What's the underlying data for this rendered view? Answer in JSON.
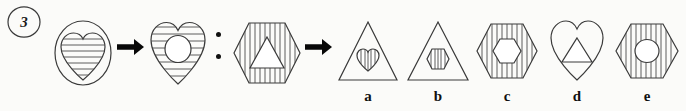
{
  "question": {
    "number": "3",
    "type": "visual-analogy",
    "relation_separator": ":",
    "arrow_symbol": "→"
  },
  "stem": {
    "pair_one": [
      {
        "position": 1,
        "name": "circle-with-striped-heart",
        "outer_shape": "circle",
        "outer_fill": "none",
        "inner_shape": "heart",
        "inner_fill": "horizontal-stripes"
      },
      {
        "position": 2,
        "name": "striped-heart-with-circle",
        "outer_shape": "heart",
        "outer_fill": "horizontal-stripes",
        "inner_shape": "circle",
        "inner_fill": "white"
      }
    ],
    "pair_two": [
      {
        "position": 3,
        "name": "striped-hexagon-with-triangle",
        "outer_shape": "hexagon",
        "outer_fill": "vertical-stripes",
        "inner_shape": "triangle",
        "inner_fill": "white"
      }
    ]
  },
  "options": [
    {
      "letter": "a",
      "name": "triangle-with-striped-heart",
      "outer_shape": "triangle",
      "outer_fill": "none",
      "inner_shape": "heart",
      "inner_fill": "vertical-stripes"
    },
    {
      "letter": "b",
      "name": "triangle-with-striped-hexagon",
      "outer_shape": "triangle",
      "outer_fill": "none",
      "inner_shape": "hexagon",
      "inner_fill": "vertical-stripes"
    },
    {
      "letter": "c",
      "name": "striped-hexagon-with-hexagon",
      "outer_shape": "hexagon",
      "outer_fill": "vertical-stripes",
      "inner_shape": "hexagon",
      "inner_fill": "white"
    },
    {
      "letter": "d",
      "name": "heart-with-triangle",
      "outer_shape": "heart",
      "outer_fill": "none",
      "inner_shape": "triangle",
      "inner_fill": "white"
    },
    {
      "letter": "e",
      "name": "striped-hexagon-with-circle",
      "outer_shape": "hexagon",
      "outer_fill": "vertical-stripes",
      "inner_shape": "circle",
      "inner_fill": "white"
    }
  ],
  "colors": {
    "background": "#fbfbf9",
    "ink": "#3a3a3a",
    "ink_bold": "#080808"
  }
}
